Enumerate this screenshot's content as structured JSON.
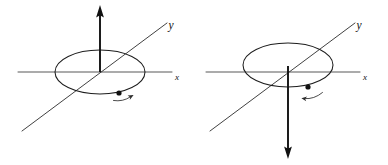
{
  "figure": {
    "background_color": "#ffffff",
    "ink_color": "#111111",
    "width": 388,
    "height": 165,
    "panel_count": 2
  },
  "panels": [
    {
      "id": "left-panel",
      "name": "left-diagram",
      "description": "Coordinate axes with vertical axis arrow pointing up; particle on circle moving counterclockwise viewed from above",
      "origin": {
        "x": 100,
        "y": 72
      },
      "vertical_axis": {
        "direction": "up",
        "arrow_head": "filled-triangle",
        "tip": {
          "x": 100,
          "y": 7
        },
        "tail": {
          "x": 100,
          "y": 72
        },
        "label": ""
      },
      "x_axis": {
        "label": "x",
        "label_position": {
          "x": 176,
          "y": 79
        },
        "start": {
          "x": 18,
          "y": 72
        },
        "end": {
          "x": 172,
          "y": 72
        }
      },
      "y_axis": {
        "label": "y",
        "label_position": {
          "x": 172,
          "y": 28
        },
        "start": {
          "x": 22,
          "y": 131
        },
        "end": {
          "x": 167,
          "y": 23
        }
      },
      "circle": {
        "center": {
          "x": 100,
          "y": 72
        },
        "radius_x": 45,
        "radius_y": 22
      },
      "particle": {
        "position": {
          "x": 119,
          "y": 93
        },
        "radius": 2.6
      },
      "motion_arrow": {
        "direction": "right",
        "sense": "counterclockwise-from-above",
        "start": {
          "x": 113,
          "y": 100
        },
        "end": {
          "x": 133,
          "y": 95
        }
      }
    },
    {
      "id": "right-panel",
      "name": "right-diagram",
      "description": "Coordinate axes with vertical axis arrow pointing down; particle on circle moving clockwise viewed from above",
      "origin": {
        "x": 288,
        "y": 72
      },
      "vertical_axis": {
        "direction": "down",
        "arrow_head": "filled-triangle",
        "tip": {
          "x": 288,
          "y": 158
        },
        "tail": {
          "x": 288,
          "y": 72
        },
        "label": ""
      },
      "x_axis": {
        "label": "x",
        "label_position": {
          "x": 364,
          "y": 79
        },
        "start": {
          "x": 206,
          "y": 72
        },
        "end": {
          "x": 360,
          "y": 72
        }
      },
      "y_axis": {
        "label": "y",
        "label_position": {
          "x": 360,
          "y": 28
        },
        "start": {
          "x": 210,
          "y": 131
        },
        "end": {
          "x": 355,
          "y": 23
        }
      },
      "circle": {
        "center": {
          "x": 288,
          "y": 65
        },
        "radius_x": 45,
        "radius_y": 22
      },
      "particle": {
        "position": {
          "x": 308,
          "y": 89
        },
        "radius": 2.6
      },
      "motion_arrow": {
        "direction": "left",
        "sense": "clockwise-from-above",
        "start": {
          "x": 322,
          "y": 92
        },
        "end": {
          "x": 302,
          "y": 99
        }
      }
    }
  ]
}
